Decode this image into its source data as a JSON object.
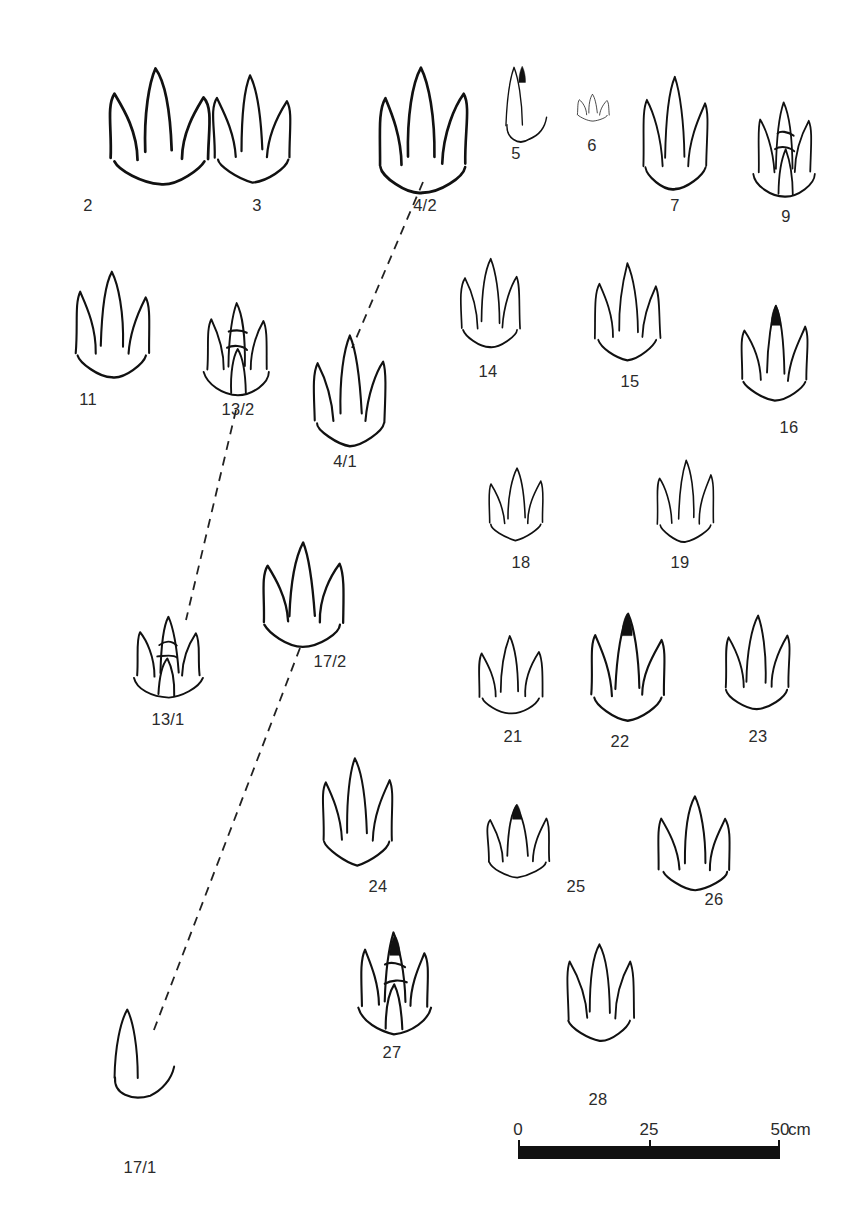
{
  "figure": {
    "type": "scientific-plate",
    "background_color": "#ffffff",
    "ink_color": "#111111",
    "label_color": "#2b2b2b"
  },
  "prints": [
    {
      "id": "p2",
      "label": "2",
      "x": 95,
      "y": 60,
      "w": 130,
      "h": 130,
      "label_x": 88,
      "label_y": 196,
      "toes": 3,
      "has_filled_claw": false,
      "note": "broad three-toed print with rounded upper pad"
    },
    {
      "id": "p3",
      "label": "3",
      "x": 200,
      "y": 70,
      "w": 105,
      "h": 115,
      "label_x": 257,
      "label_y": 196,
      "toes": 3,
      "has_filled_claw": false,
      "note": "three slender toes with pad divisions"
    },
    {
      "id": "p4_2",
      "label": "4/2",
      "x": 360,
      "y": 58,
      "w": 125,
      "h": 140,
      "label_x": 425,
      "label_y": 196,
      "toes": 3,
      "has_filled_claw": false,
      "note": "large rounded three-toed print, paired with 4/1"
    },
    {
      "id": "p5",
      "label": "5",
      "x": 490,
      "y": 62,
      "w": 65,
      "h": 85,
      "label_x": 516,
      "label_y": 144,
      "toes": 2,
      "has_filled_claw": true,
      "note": "partial print, single clawed digit"
    },
    {
      "id": "p6",
      "label": "6",
      "x": 572,
      "y": 92,
      "w": 42,
      "h": 30,
      "label_x": 592,
      "label_y": 136,
      "toes": 3,
      "has_filled_claw": false,
      "note": "three small adjacent oval pads"
    },
    {
      "id": "p7",
      "label": "7",
      "x": 630,
      "y": 70,
      "w": 90,
      "h": 125,
      "label_x": 675,
      "label_y": 196,
      "toes": 3,
      "has_filled_claw": false,
      "note": "slim three-toed theropod-style print"
    },
    {
      "id": "p9",
      "label": "9",
      "x": 742,
      "y": 100,
      "w": 85,
      "h": 100,
      "label_x": 786,
      "label_y": 207,
      "toes": 4,
      "has_filled_claw": false,
      "note": "four toe pads with segment divisions"
    },
    {
      "id": "p11",
      "label": "11",
      "x": 62,
      "y": 262,
      "w": 100,
      "h": 120,
      "label_x": 88,
      "label_y": 390,
      "toes": 3,
      "has_filled_claw": false,
      "note": "open, incomplete three-toed outline"
    },
    {
      "id": "p13_2",
      "label": "13/2",
      "x": 192,
      "y": 298,
      "w": 90,
      "h": 100,
      "label_x": 238,
      "label_y": 400,
      "toes": 4,
      "has_filled_claw": false,
      "note": "segmented toes over a rectangular heel, paired with 13/1"
    },
    {
      "id": "p4_1",
      "label": "4/1",
      "x": 300,
      "y": 330,
      "w": 100,
      "h": 120,
      "label_x": 345,
      "label_y": 452,
      "toes": 3,
      "has_filled_claw": false,
      "note": "rounded three-toed print, paired with 4/2"
    },
    {
      "id": "p14",
      "label": "14",
      "x": 450,
      "y": 252,
      "w": 80,
      "h": 100,
      "label_x": 488,
      "label_y": 362,
      "toes": 3,
      "has_filled_claw": false,
      "note": "compact three-toed print"
    },
    {
      "id": "p15",
      "label": "15",
      "x": 585,
      "y": 258,
      "w": 85,
      "h": 105,
      "label_x": 630,
      "label_y": 372,
      "toes": 3,
      "has_filled_claw": false,
      "note": "three separated lanceolate toes"
    },
    {
      "id": "p16",
      "label": "16",
      "x": 730,
      "y": 300,
      "w": 90,
      "h": 105,
      "label_x": 789,
      "label_y": 418,
      "toes": 3,
      "has_filled_claw": true,
      "note": "broad print with filled central claw"
    },
    {
      "id": "p18",
      "label": "18",
      "x": 478,
      "y": 462,
      "w": 75,
      "h": 80,
      "label_x": 521,
      "label_y": 553,
      "toes": 3,
      "has_filled_claw": false,
      "note": "three separate digit impressions"
    },
    {
      "id": "p19",
      "label": "19",
      "x": 648,
      "y": 455,
      "w": 75,
      "h": 90,
      "label_x": 680,
      "label_y": 553,
      "toes": 3,
      "has_filled_claw": false,
      "note": "three digits with heel drag"
    },
    {
      "id": "p13_1",
      "label": "13/1",
      "x": 120,
      "y": 615,
      "w": 95,
      "h": 85,
      "label_x": 168,
      "label_y": 710,
      "toes": 4,
      "has_filled_claw": false,
      "note": "splayed toes with elongate claw, paired with 13/2"
    },
    {
      "id": "p17_2",
      "label": "17/2",
      "x": 248,
      "y": 535,
      "w": 110,
      "h": 115,
      "label_x": 330,
      "label_y": 652,
      "toes": 3,
      "has_filled_claw": false,
      "note": "bird-like three-toed print, paired with 17/1"
    },
    {
      "id": "p21",
      "label": "21",
      "x": 468,
      "y": 632,
      "w": 85,
      "h": 85,
      "label_x": 513,
      "label_y": 727,
      "toes": 3,
      "has_filled_claw": false,
      "note": "three isolated digit marks"
    },
    {
      "id": "p22",
      "label": "22",
      "x": 578,
      "y": 608,
      "w": 100,
      "h": 115,
      "label_x": 620,
      "label_y": 732,
      "toes": 3,
      "has_filled_claw": true,
      "note": "three toes with filled pad joints"
    },
    {
      "id": "p23",
      "label": "23",
      "x": 712,
      "y": 608,
      "w": 90,
      "h": 105,
      "label_x": 758,
      "label_y": 727,
      "toes": 3,
      "has_filled_claw": false,
      "note": "three thick separated digits"
    },
    {
      "id": "p24",
      "label": "24",
      "x": 310,
      "y": 752,
      "w": 95,
      "h": 115,
      "label_x": 378,
      "label_y": 877,
      "toes": 3,
      "has_filled_claw": false,
      "note": "sharp three-toed print"
    },
    {
      "id": "p25",
      "label": "25",
      "x": 475,
      "y": 800,
      "w": 85,
      "h": 80,
      "label_x": 576,
      "label_y": 877,
      "toes": 3,
      "has_filled_claw": true,
      "note": "three elongate digits, one with filled tip"
    },
    {
      "id": "p26",
      "label": "26",
      "x": 648,
      "y": 790,
      "w": 95,
      "h": 105,
      "label_x": 714,
      "label_y": 890,
      "toes": 3,
      "has_filled_claw": false,
      "note": "four-rayed print with circular central mark"
    },
    {
      "id": "p27",
      "label": "27",
      "x": 345,
      "y": 930,
      "w": 100,
      "h": 105,
      "label_x": 392,
      "label_y": 1043,
      "toes": 4,
      "has_filled_claw": true,
      "note": "four digits with filled claw and round heel"
    },
    {
      "id": "p28",
      "label": "28",
      "x": 555,
      "y": 935,
      "w": 90,
      "h": 110,
      "label_x": 598,
      "label_y": 1090,
      "toes": 3,
      "has_filled_claw": false,
      "note": "three long narrow digits"
    },
    {
      "id": "p17_1",
      "label": "17/1",
      "x": 90,
      "y": 1000,
      "w": 95,
      "h": 105,
      "label_x": 140,
      "label_y": 1158,
      "toes": 2,
      "has_filled_claw": false,
      "note": "partial bird-like print, paired with 17/2"
    }
  ],
  "connectors": [
    {
      "id": "c4",
      "from_label": "4/2",
      "to_label": "4/1",
      "x1": 423,
      "y1": 182,
      "x2": 352,
      "y2": 348,
      "style": "dashed"
    },
    {
      "id": "c13",
      "from_label": "13/2",
      "to_label": "13/1",
      "x1": 236,
      "y1": 410,
      "x2": 186,
      "y2": 620,
      "style": "dashed"
    },
    {
      "id": "c17",
      "from_label": "17/2",
      "to_label": "17/1",
      "x1": 300,
      "y1": 648,
      "x2": 152,
      "y2": 1035,
      "style": "dashed"
    }
  ],
  "scalebar": {
    "x": 518,
    "y": 1120,
    "length_px": 262,
    "height_px": 13,
    "ticks": [
      {
        "value": "0",
        "offset": 0
      },
      {
        "value": "25",
        "offset": 131
      },
      {
        "value": "50",
        "offset": 262
      }
    ],
    "unit": "cm",
    "color": "#111111"
  }
}
